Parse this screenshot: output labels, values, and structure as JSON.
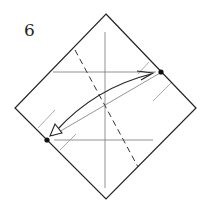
{
  "diagram": {
    "step_number": "6",
    "type": "origami-fold-step",
    "colors": {
      "outline": "#222222",
      "crease": "#777777",
      "dashed_fold": "#333333",
      "dot": "#111111",
      "background": "#ffffff"
    }
  }
}
